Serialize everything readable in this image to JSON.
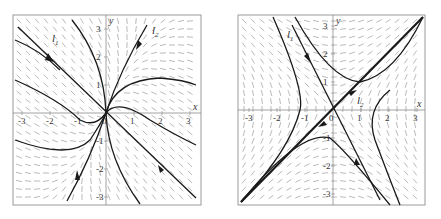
{
  "figure": {
    "panels": [
      {
        "id": "left",
        "type": "phase-portrait-node",
        "frame": {
          "x": 13,
          "y": 15,
          "w": 188,
          "h": 190
        },
        "origin": {
          "x": 106,
          "y": 113
        },
        "scale": 28,
        "x_axis_label": "x",
        "y_axis_label": "y",
        "x_ticks": [
          "-3",
          "-2",
          "-1",
          "0",
          "1",
          "2",
          "3"
        ],
        "y_ticks": [
          "3",
          "2",
          "1",
          "-1",
          "-2",
          "-3"
        ],
        "eigenline_labels": [
          "l1",
          "l2"
        ],
        "eigenline_label_text": [
          {
            "base": "l",
            "sub": "1"
          },
          {
            "base": "l",
            "sub": "2"
          }
        ]
      },
      {
        "id": "right",
        "type": "phase-portrait-saddle",
        "frame": {
          "x": 238,
          "y": 15,
          "w": 187,
          "h": 190
        },
        "origin": {
          "x": 333,
          "y": 110
        },
        "scale": 28,
        "x_axis_label": "x",
        "y_axis_label": "y",
        "x_ticks": [
          "-3",
          "-2",
          "-1",
          "0",
          "1",
          "2",
          "3"
        ],
        "y_ticks": [
          "3",
          "2",
          "1",
          "-1",
          "-2",
          "-3"
        ],
        "eigenline_labels": [
          "l1",
          "l2"
        ],
        "eigenline_label_text": [
          {
            "base": "l",
            "sub": "1"
          },
          {
            "base": "l",
            "sub": "2"
          }
        ]
      }
    ],
    "colors": {
      "frame": "#9a9a9a",
      "axis": "#8c8c8c",
      "field": "#8a8a8a",
      "trajectory": "#1a1a1a",
      "text": "#333333"
    }
  }
}
